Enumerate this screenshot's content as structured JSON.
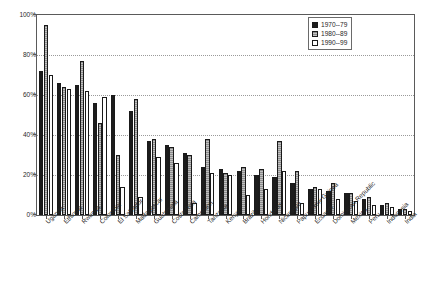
{
  "chart_data": {
    "type": "bar",
    "title": "",
    "xlabel": "",
    "ylabel": "",
    "ylim": [
      0,
      100
    ],
    "yticks": [
      "0%",
      "20%",
      "40%",
      "60%",
      "80%",
      "100%"
    ],
    "ytick_values": [
      0,
      20,
      40,
      60,
      80,
      100
    ],
    "grid": true,
    "legend_position": "top-right",
    "categories": [
      "Uganda",
      "Ethiopia",
      "Rwanda",
      "Colombia",
      "El Salvador",
      "Madagascar",
      "Guatemala",
      "Costa Rica",
      "Cameroon",
      "Tanzania",
      "Kenya",
      "Brazil",
      "Honduras",
      "Nicaragua",
      "Papua New Guinea",
      "Ecuador",
      "Dominican Republic",
      "Mexico",
      "Peru",
      "Indonesia",
      "India"
    ],
    "series": [
      {
        "name": "1970--79",
        "values": [
          72,
          66,
          65,
          56,
          60,
          52,
          37,
          35,
          31,
          24,
          23,
          22,
          20,
          19,
          16,
          13,
          12,
          11,
          8,
          5,
          3
        ]
      },
      {
        "name": "1980--89",
        "values": [
          95,
          64,
          77,
          46,
          30,
          58,
          38,
          34,
          30,
          38,
          21,
          24,
          23,
          37,
          22,
          14,
          16,
          11,
          9,
          6,
          3
        ]
      },
      {
        "name": "1990--99",
        "values": [
          70,
          63,
          62,
          59,
          14,
          9,
          29,
          26,
          6,
          21,
          20,
          10,
          13,
          22,
          6,
          13,
          8,
          7,
          5,
          4,
          2
        ]
      }
    ]
  },
  "legend": {
    "entries": [
      {
        "label": "1970--79"
      },
      {
        "label": "1980--89"
      },
      {
        "label": "1990--99"
      }
    ]
  },
  "colors": {
    "series_1970": "#1c1c1c",
    "series_1980": "#8c8c8c",
    "series_1990": "#ffffff",
    "axis": "#5a5a5a",
    "grid": "#9a9a9a"
  }
}
